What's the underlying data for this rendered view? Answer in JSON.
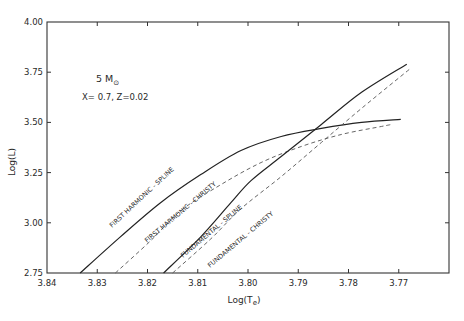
{
  "chart_data": {
    "type": "line",
    "title": "",
    "xlabel": "Log(Te)",
    "ylabel": "Log(L)",
    "xlim": [
      3.84,
      3.76
    ],
    "ylim": [
      2.75,
      4.0
    ],
    "x_reversed": true,
    "grid": false,
    "x_ticks": [
      "3.84",
      "3.83",
      "3.82",
      "3.81",
      "3.80",
      "3.79",
      "3.78",
      "3.77"
    ],
    "y_ticks": [
      "2.75",
      "3.00",
      "3.25",
      "3.50",
      "3.75",
      "4.00"
    ],
    "annotations": [
      {
        "text": "5 M⊙",
        "x": 3.8275,
        "y": 3.655
      },
      {
        "text": "X= 0.7,  Z=0.02",
        "x": 3.8285,
        "y": 3.595
      }
    ],
    "series": [
      {
        "name": "FIRST HARMONIC - SPLINE",
        "style": "solid",
        "x": [
          3.8334,
          3.8254,
          3.8174,
          3.8094,
          3.8014,
          3.7934,
          3.7854,
          3.7774,
          3.7696
        ],
        "y": [
          2.75,
          2.93,
          3.1,
          3.24,
          3.36,
          3.43,
          3.47,
          3.5,
          3.515
        ]
      },
      {
        "name": "FIRST HARMONIC - CHRISTY",
        "style": "dashed",
        "x": [
          3.8264,
          3.8194,
          3.8134,
          3.8054,
          3.7974,
          3.7894,
          3.7814,
          3.7734,
          3.7714
        ],
        "y": [
          2.75,
          2.91,
          3.06,
          3.19,
          3.3,
          3.38,
          3.44,
          3.48,
          3.49
        ]
      },
      {
        "name": "FUNDAMENTAL - SPLINE",
        "style": "solid",
        "x": [
          3.8168,
          3.8094,
          3.8034,
          3.7994,
          3.7934,
          3.7854,
          3.7774,
          3.7684
        ],
        "y": [
          2.75,
          2.93,
          3.1,
          3.21,
          3.33,
          3.49,
          3.65,
          3.79
        ]
      },
      {
        "name": "FUNDAMENTAL - CHRISTY",
        "style": "dashed",
        "x": [
          3.815,
          3.8074,
          3.8014,
          3.7934,
          3.7854,
          3.7774,
          3.7676
        ],
        "y": [
          2.75,
          2.92,
          3.07,
          3.23,
          3.4,
          3.57,
          3.77
        ]
      }
    ],
    "curve_labels": [
      {
        "text": "FIRST  HARMONIC - SPLINE",
        "series": 0
      },
      {
        "text": "FIRST  HARMONIC - CHRISTY",
        "series": 1
      },
      {
        "text": "FUNDAMENTAL - SPLINE",
        "series": 2
      },
      {
        "text": "FUNDAMENTAL - CHRISTY",
        "series": 3
      }
    ]
  }
}
